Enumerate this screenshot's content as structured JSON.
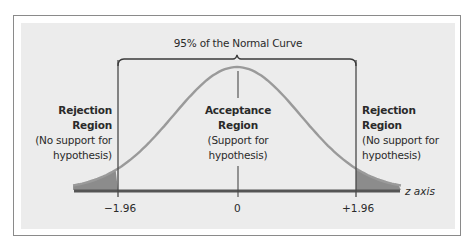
{
  "diagram": {
    "title": "95% of the Normal Curve",
    "axis_label": "z axis",
    "ticks": {
      "negative": "−1.96",
      "zero": "0",
      "positive": "+1.96"
    },
    "regions": {
      "left": {
        "heading_line1": "Rejection",
        "heading_line2": "Region",
        "note_line1": "(No support for",
        "note_line2": "hypothesis)"
      },
      "center": {
        "heading_line1": "Acceptance",
        "heading_line2": "Region",
        "note_line1": "(Support for",
        "note_line2": "hypothesis)"
      },
      "right": {
        "heading_line1": "Rejection",
        "heading_line2": "Region",
        "note_line1": "(No support for",
        "note_line2": "hypothesis)"
      }
    },
    "colors": {
      "panel": "#ececec",
      "curve": "#9a9a9a",
      "tail_fill": "#8c8c8c",
      "axis": "#555555",
      "lines": "#4a4a4a",
      "text": "#2a2a2a"
    },
    "critical_values": [
      -1.96,
      1.96
    ],
    "confidence_percent": 95
  }
}
